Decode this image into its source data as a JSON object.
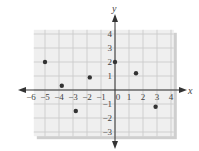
{
  "chart_data": {
    "type": "scatter",
    "title": "",
    "xlabel": "x",
    "ylabel": "y",
    "xlim": [
      -6,
      4
    ],
    "ylim": [
      -3,
      4
    ],
    "grid": true,
    "x_ticks": [
      -6,
      -5,
      -4,
      -3,
      -2,
      -1,
      0,
      1,
      2,
      3,
      4
    ],
    "y_ticks": [
      -3,
      -2,
      -1,
      1,
      2,
      3,
      4
    ],
    "points": [
      {
        "x": -5,
        "y": 2
      },
      {
        "x": -3.8,
        "y": 0.3
      },
      {
        "x": -2.8,
        "y": -1.5
      },
      {
        "x": -1.8,
        "y": 0.9
      },
      {
        "x": 0,
        "y": 2
      },
      {
        "x": 1.5,
        "y": 1.2
      },
      {
        "x": 2.9,
        "y": -1.2
      }
    ]
  },
  "colors": {
    "grid": "#c8c8c8",
    "panel": "#efefef",
    "shadow": "#cfcfcf",
    "axis": "#333333",
    "point": "#333333"
  }
}
